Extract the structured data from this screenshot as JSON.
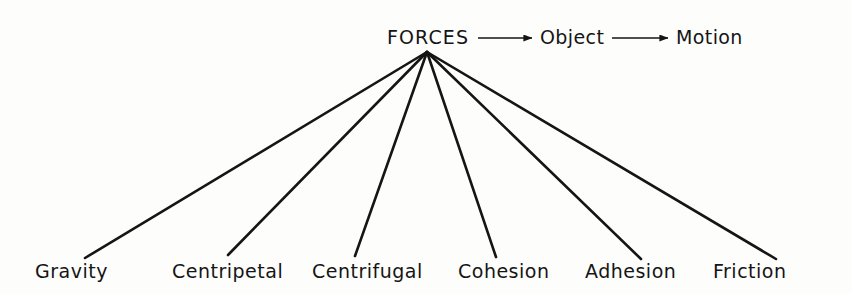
{
  "diagram": {
    "type": "fan-hierarchy",
    "background_color": "#fdfdfc",
    "ink_color": "#151515",
    "root": {
      "label": "FORCES",
      "apex": {
        "x": 427,
        "y": 52
      }
    },
    "chain": {
      "nodes": [
        {
          "id": "forces",
          "label": "FORCES"
        },
        {
          "id": "object",
          "label": "Object"
        },
        {
          "id": "motion",
          "label": "Motion"
        }
      ],
      "arrows": [
        {
          "from": "FORCES",
          "to": "Object",
          "x1": 478,
          "x2": 532,
          "y": 38
        },
        {
          "from": "Object",
          "to": "Motion",
          "x1": 612,
          "x2": 668,
          "y": 38
        }
      ]
    },
    "branches": [
      {
        "label": "Gravity",
        "line": {
          "x1": 427,
          "y1": 52,
          "x2": 85,
          "y2": 258
        }
      },
      {
        "label": "Centripetal",
        "line": {
          "x1": 427,
          "y1": 52,
          "x2": 228,
          "y2": 255
        }
      },
      {
        "label": "Centrifugal",
        "line": {
          "x1": 427,
          "y1": 52,
          "x2": 355,
          "y2": 256
        }
      },
      {
        "label": "Cohesion",
        "line": {
          "x1": 427,
          "y1": 52,
          "x2": 496,
          "y2": 257
        }
      },
      {
        "label": "Adhesion",
        "line": {
          "x1": 427,
          "y1": 52,
          "x2": 641,
          "y2": 259
        }
      },
      {
        "label": "Friction",
        "line": {
          "x1": 427,
          "y1": 52,
          "x2": 776,
          "y2": 259
        }
      }
    ]
  }
}
